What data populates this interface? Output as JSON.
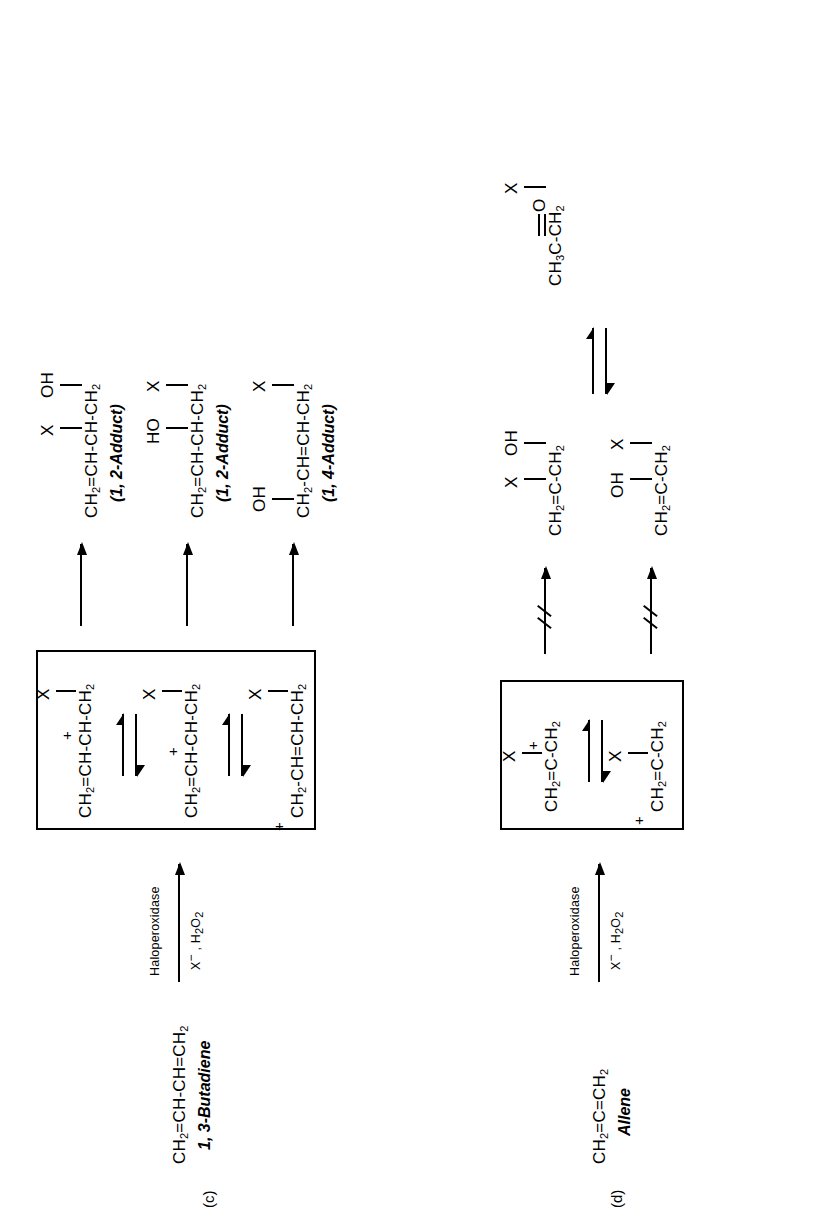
{
  "figure": {
    "type": "reaction-scheme",
    "panels": [
      {
        "id": "c",
        "label": "(c)",
        "substrate": {
          "formula": "CH2=CH-CH=CH2",
          "name": "1, 3-Butadiene"
        },
        "reagent": {
          "above": "Haloperoxidase",
          "below": "X⁻ , H2O2"
        },
        "intermediates": [
          {
            "formula": "CH2=CH-CH-CH2",
            "charge": "+",
            "substituent": "X",
            "charge_pos": "C3"
          },
          {
            "formula": "CH2=CH-CH-CH2",
            "charge": "+",
            "substituent": "X",
            "charge_pos": "C3-mid"
          },
          {
            "formula": "CH2-CH=CH-CH2",
            "charge": "+",
            "substituent": "X",
            "charge_pos": "C1"
          }
        ],
        "products": [
          {
            "formula": "CH2=CH-CH-CH2",
            "sub_left": "X",
            "sub_right": "OH",
            "label": "(1, 2-Adduct)"
          },
          {
            "formula": "CH2=CH-CH-CH2",
            "sub_left": "HO",
            "sub_right": "X",
            "label": "(1, 2-Adduct)"
          },
          {
            "formula": "CH2-CH=CH-CH2",
            "sub_left": "OH",
            "sub_right": "X",
            "label": "(1, 4-Adduct)"
          }
        ]
      },
      {
        "id": "d",
        "label": "(d)",
        "substrate": {
          "formula": "CH2=C=CH2",
          "name": "Allene"
        },
        "reagent": {
          "above": "Haloperoxidase",
          "below": "X⁻ , H2O2"
        },
        "intermediates": [
          {
            "formula": "CH2=C-CH2",
            "charge": "+",
            "substituent": "X"
          },
          {
            "formula": "CH2=C-CH2",
            "charge": "+",
            "substituent": "X"
          }
        ],
        "products": [
          {
            "formula": "CH2=C-CH2",
            "sub_left": "X",
            "sub_right": "OH"
          },
          {
            "formula": "CH2=C-CH2",
            "sub_left": "OH",
            "sub_right": "X"
          }
        ],
        "final_product": {
          "formula": "CH3C(=O)-CH2-X",
          "carbonyl": "O"
        }
      }
    ]
  },
  "labels": {
    "panel_c": "(c)",
    "panel_d": "(d)",
    "butadiene_name": "1, 3-Butadiene",
    "allene_name": "Allene",
    "haloperoxidase": "Haloperoxidase",
    "adduct_12": "(1, 2-Adduct)",
    "adduct_14": "(1, 4-Adduct)",
    "X": "X",
    "OH": "OH",
    "HO": "HO",
    "O": "O",
    "plus": "+",
    "CH2": "CH",
    "sub2": "2",
    "sub3": "3"
  },
  "colors": {
    "ink": "#000000",
    "background": "#ffffff"
  }
}
